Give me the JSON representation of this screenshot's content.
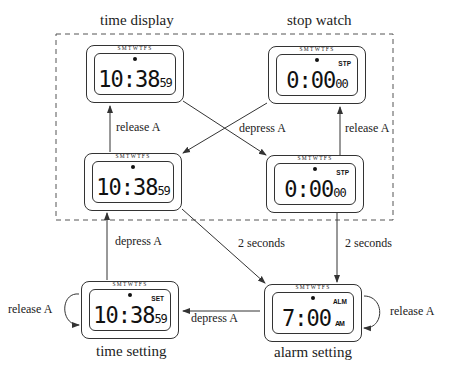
{
  "titles": {
    "time_display": "time display",
    "stop_watch": "stop watch",
    "time_setting": "time setting",
    "alarm_setting": "alarm setting"
  },
  "watches": {
    "time_display_1": {
      "days": "SMTWTFS",
      "main": "10:38",
      "sub": "59",
      "tag": ""
    },
    "stop_watch_1": {
      "days": "SMTWTFS",
      "main": "0:00",
      "sub": "00",
      "tag": "STP"
    },
    "time_display_2": {
      "days": "SMTWTFS",
      "main": "10:38",
      "sub": "59",
      "tag": ""
    },
    "stop_watch_2": {
      "days": "SMTWTFS",
      "main": "0:00",
      "sub": "00",
      "tag": "STP"
    },
    "time_setting": {
      "days": "SMTWTFS",
      "main": "10:38",
      "sub": "59",
      "tag": "SET"
    },
    "alarm_setting": {
      "days": "SMTWTFS",
      "main": "7:00",
      "sub": "AM",
      "tag": "ALM"
    }
  },
  "transitions": {
    "release_a_left": "release A",
    "depress_a_cross": "depress A",
    "release_a_right": "release A",
    "depress_a_left_lower": "depress A",
    "two_seconds_diag": "2 seconds",
    "two_seconds_right": "2 seconds",
    "release_a_loop_left": "release A",
    "depress_a_bottom": "depress A",
    "release_a_loop_right": "release A"
  },
  "colors": {
    "line": "#333333",
    "dash": "#555555"
  }
}
